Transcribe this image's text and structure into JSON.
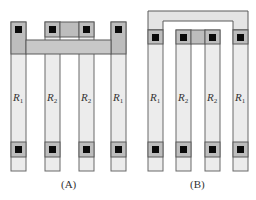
{
  "diagram": {
    "type": "resistor-layout-comparison",
    "panels": [
      {
        "id": "A",
        "caption": "(A)",
        "resistors": [
          {
            "label": "R",
            "sub": "1"
          },
          {
            "label": "R",
            "sub": "2"
          },
          {
            "label": "R",
            "sub": "2"
          },
          {
            "label": "R",
            "sub": "1"
          }
        ],
        "interconnect": "horizontal bar joining outer R1 strips; inner R2 contacts bridged"
      },
      {
        "id": "B",
        "caption": "(B)",
        "resistors": [
          {
            "label": "R",
            "sub": "1"
          },
          {
            "label": "R",
            "sub": "2"
          },
          {
            "label": "R",
            "sub": "2"
          },
          {
            "label": "R",
            "sub": "1"
          }
        ],
        "interconnect": "U-shaped overhead bar joining outer R1 strips; inner R2 contacts bridged"
      }
    ],
    "colors": {
      "strip_fill": "#ececec",
      "pad_fill": "#bdbdbd",
      "contact": "#0a0a0a",
      "outline": "#5a5a5a"
    }
  }
}
